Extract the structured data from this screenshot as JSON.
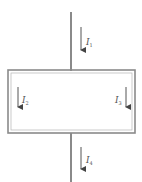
{
  "diagram": {
    "type": "circuit-current-divider",
    "colors": {
      "wire": "#8a8a8a",
      "arrow": "#555555",
      "label": "#555555",
      "background": "#ffffff"
    },
    "currents": [
      {
        "id": "I1",
        "symbol": "I",
        "subscript": "1",
        "position": "top-wire",
        "direction": "down"
      },
      {
        "id": "I2",
        "symbol": "I",
        "subscript": "2",
        "position": "left-branch",
        "direction": "down"
      },
      {
        "id": "I3",
        "symbol": "I",
        "subscript": "3",
        "position": "right-branch",
        "direction": "down"
      },
      {
        "id": "I4",
        "symbol": "I",
        "subscript": "4",
        "position": "bottom-wire",
        "direction": "down"
      }
    ]
  }
}
